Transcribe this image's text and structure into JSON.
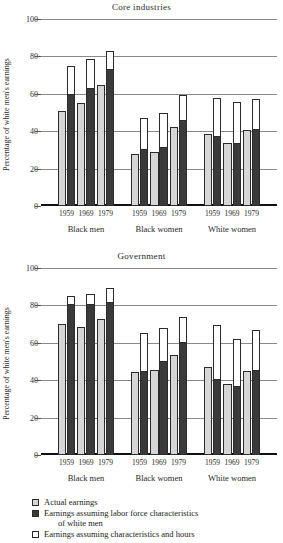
{
  "figure": {
    "ylabel": "Percentage of white men's earnings",
    "yticks": [
      0,
      20,
      40,
      60,
      80,
      100
    ],
    "ylim": [
      0,
      100
    ],
    "group_labels": [
      "Black men",
      "Black women",
      "White women"
    ],
    "years": [
      "1959",
      "1969",
      "1979"
    ]
  },
  "legend": {
    "items": [
      {
        "swatch": "light-gray-square",
        "label": "Actual earnings",
        "label2": ""
      },
      {
        "swatch": "dark-gray-square",
        "label": "Earnings assuming labor force characteristics",
        "label2": "of white men"
      },
      {
        "swatch": "white-square",
        "label": "Earnings assuming characteristics and hours",
        "label2": ""
      }
    ]
  },
  "chart_data": [
    {
      "type": "bar",
      "title": "Core industries",
      "xlabel": "",
      "ylabel": "Percentage of white men's earnings",
      "ylim": [
        0,
        100
      ],
      "yticks": [
        0,
        20,
        40,
        60,
        80,
        100
      ],
      "grid": true,
      "legend_position": "below-figure",
      "groups": [
        "Black men",
        "Black women",
        "White women"
      ],
      "categories": [
        "1959",
        "1969",
        "1979"
      ],
      "series": [
        {
          "name": "Actual earnings",
          "values": {
            "Black men": [
              51,
              55,
              64.5
            ],
            "Black women": [
              28,
              29,
              42.5
            ],
            "White women": [
              38.5,
              33.5,
              40.5
            ]
          }
        },
        {
          "name": "Earnings assuming labor force characteristics of white men",
          "values": {
            "Black men": [
              60,
              63,
              73.5
            ],
            "Black women": [
              30.5,
              31.5,
              46
            ],
            "White women": [
              37.5,
              33.5,
              41
            ]
          }
        },
        {
          "name": "Earnings assuming characteristics and hours",
          "values": {
            "Black men": [
              75,
              78.5,
              83
            ],
            "Black women": [
              47,
              50,
              59.5
            ],
            "White women": [
              58,
              55.5,
              57
            ]
          }
        }
      ]
    },
    {
      "type": "bar",
      "title": "Government",
      "xlabel": "",
      "ylabel": "Percentage of white men's earnings",
      "ylim": [
        0,
        100
      ],
      "yticks": [
        0,
        20,
        40,
        60,
        80,
        100
      ],
      "grid": true,
      "legend_position": "below-figure",
      "groups": [
        "Black men",
        "Black women",
        "White women"
      ],
      "categories": [
        "1959",
        "1969",
        "1979"
      ],
      "series": [
        {
          "name": "Actual earnings",
          "values": {
            "Black men": [
              70,
              68.5,
              72.5
            ],
            "Black women": [
              44.5,
              45.5,
              53.5
            ],
            "White women": [
              47,
              38,
              45
            ]
          }
        },
        {
          "name": "Earnings assuming labor force characteristics of white men",
          "values": {
            "Black men": [
              81,
              80.5,
              82
            ],
            "Black women": [
              45,
              50.5,
              60.5
            ],
            "White women": [
              40.5,
              37,
              45.5
            ]
          }
        },
        {
          "name": "Earnings assuming characteristics and hours",
          "values": {
            "Black men": [
              85,
              86,
              89.5
            ],
            "Black women": [
              65.5,
              68,
              74
            ],
            "White women": [
              69.5,
              62,
              67
            ]
          }
        }
      ]
    }
  ]
}
